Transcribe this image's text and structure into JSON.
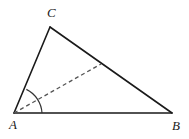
{
  "figure": {
    "kind": "geometry-diagram",
    "background_color": "#ffffff",
    "stroke_color": "#1a1a1a",
    "dashed_color": "#555555",
    "arc_color": "#333333",
    "stroke_width": 1.6,
    "dash_pattern": "4 3",
    "vertices": [
      {
        "name": "A",
        "label": "A",
        "x": 14,
        "y": 113
      },
      {
        "name": "B",
        "label": "B",
        "x": 172,
        "y": 113
      },
      {
        "name": "C",
        "label": "C",
        "x": 50,
        "y": 27
      }
    ],
    "sides": [
      {
        "name": "AB",
        "from": "A",
        "to": "B",
        "style": "solid"
      },
      {
        "name": "BC",
        "from": "B",
        "to": "C",
        "style": "solid"
      },
      {
        "name": "CA",
        "from": "C",
        "to": "A",
        "style": "solid"
      }
    ],
    "cevian": {
      "name": "angle-bisector-AD",
      "from_x": 14,
      "from_y": 113,
      "to_x": 101,
      "to_y": 64,
      "style": "dashed"
    },
    "angle_arc": {
      "name": "angle-at-A",
      "center_x": 14,
      "center_y": 113,
      "radius": 28,
      "start_x": 42,
      "start_y": 113,
      "end_x": 26.35,
      "end_y": 89.36
    },
    "labels": {
      "A": "A",
      "B": "B",
      "C": "C"
    }
  }
}
